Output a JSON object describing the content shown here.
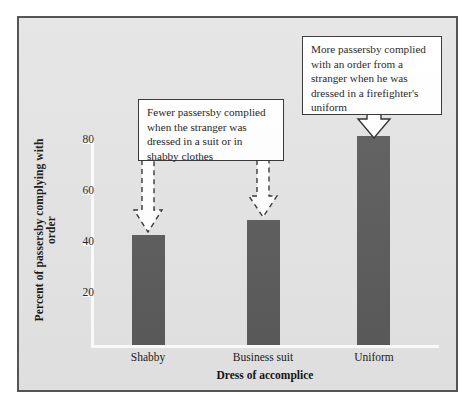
{
  "chart_data": {
    "type": "bar",
    "title": "",
    "categories": [
      "Shabby",
      "Business suit",
      "Uniform"
    ],
    "values": [
      43,
      49,
      82
    ],
    "xlabel": "Dress of accomplice",
    "ylabel": "Percent of passersby complying with order",
    "ylim": [
      0,
      90
    ],
    "yticks": [
      20,
      40,
      60,
      80
    ],
    "ytick_labels": [
      "20",
      "40",
      "60",
      "80"
    ],
    "grid": false,
    "legend": "none",
    "bar_color": "#585858",
    "plot_background": "#e3e3e3",
    "axis_color": "#fdfdfd",
    "annotations": [
      {
        "id": "callout-left",
        "text": "Fewer passersby complied when the stranger was dressed in a suit or in shabby clothes",
        "points_to": [
          "Shabby",
          "Business suit"
        ],
        "arrow_style": "dashed"
      },
      {
        "id": "callout-right",
        "text": "More passersby complied with an order from a stranger when he was dressed in a firefighter's uniform",
        "points_to": [
          "Uniform"
        ],
        "arrow_style": "solid"
      }
    ]
  },
  "figure": {
    "border_color": "#555558",
    "page_background": "#ffffff"
  },
  "axis": {
    "y_title": "Percent of passersby complying with order",
    "x_title": "Dress of accomplice",
    "y_tick_80": "80",
    "y_tick_60": "60",
    "y_tick_40": "40",
    "y_tick_20": "20"
  },
  "bars": {
    "shabby_label": "Shabby",
    "business_label": "Business suit",
    "uniform_label": "Uniform"
  },
  "callouts": {
    "left_text": "Fewer passersby complied when the stranger was dressed in a suit or in shabby clothes",
    "right_text": "More passersby complied with an order from a stranger when he was dressed in a firefighter's uniform"
  }
}
